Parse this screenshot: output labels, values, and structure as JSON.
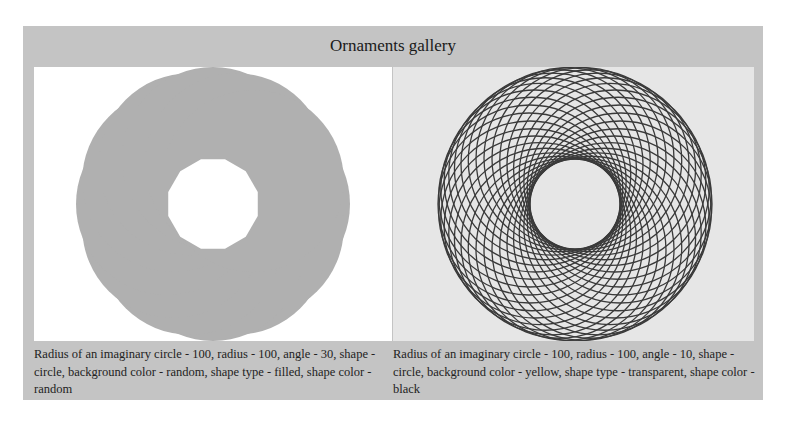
{
  "gallery": {
    "title": "Ornaments gallery",
    "frame_color": "#c4c4c4",
    "items": [
      {
        "caption": "Radius of an imaginary circle - 100, radius - 100, angle - 30, shape - circle, background color - random, shape type - filled, shape color - random",
        "imaginary_circle_radius": 100,
        "radius": 100,
        "angle": 30,
        "shape": "circle",
        "background_color": "#ffffff",
        "shape_type": "filled",
        "shape_color": "#b0b0b0"
      },
      {
        "caption": "Radius of an imaginary circle - 100, radius - 100, angle - 10, shape - circle, background color - yellow, shape type - transparent, shape color - black",
        "imaginary_circle_radius": 100,
        "radius": 100,
        "angle": 10,
        "shape": "circle",
        "background_color": "#e6e6e6",
        "shape_type": "transparent",
        "shape_color": "#3a3a3a"
      }
    ]
  }
}
